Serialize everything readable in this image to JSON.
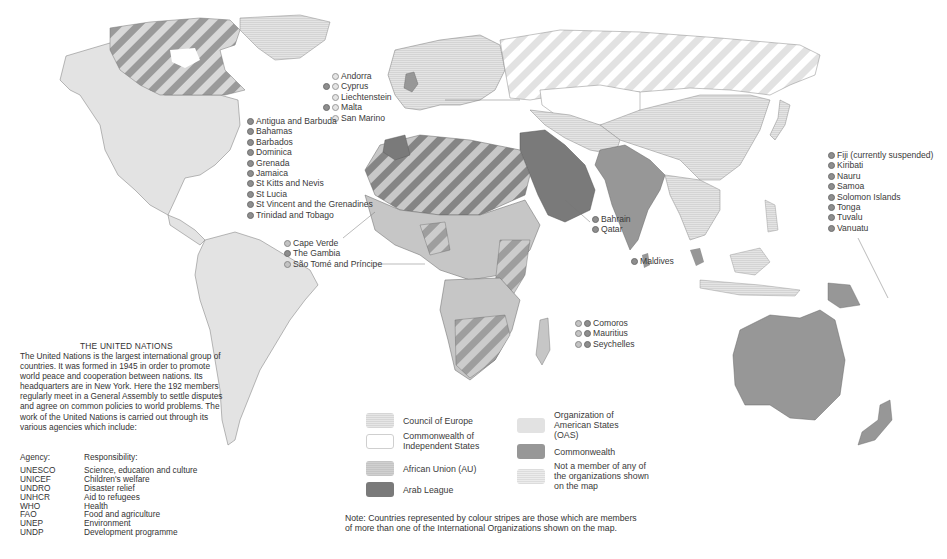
{
  "colors": {
    "council_of_europe": "#e0e0e0",
    "cis": "#ffffff",
    "african_union": "#c6c6c6",
    "arab_league": "#7a7a7a",
    "oas": "#e2e2e2",
    "commonwealth": "#979797",
    "not_member": "#e8e8e8",
    "border": "#555555"
  },
  "callouts": {
    "europe_small": [
      "Andorra",
      "Cyprus",
      "Liechtenstein",
      "Malta",
      "San Marino"
    ],
    "caribbean": [
      "Antigua and Barbuda",
      "Bahamas",
      "Barbados",
      "Dominica",
      "Grenada",
      "Jamaica",
      "St Kitts and Nevis",
      "St Lucia",
      "St Vincent and the Grenadines",
      "Trinidad and Tobago"
    ],
    "west_africa": [
      "Cape Verde",
      "The Gambia",
      "São Tomé and Príncipe"
    ],
    "gulf": [
      "Bahrain",
      "Qatar"
    ],
    "maldives": [
      "Maldives"
    ],
    "indian_ocean": [
      "Comoros",
      "Mauritius",
      "Seychelles"
    ],
    "pacific": [
      "Fiji (currently suspended)",
      "Kiribati",
      "Nauru",
      "Samoa",
      "Solomon Islands",
      "Tonga",
      "Tuvalu",
      "Vanuatu"
    ]
  },
  "un": {
    "title": "THE UNITED NATIONS",
    "body": "The United Nations is the largest international group of countries. It was formed in 1945 in order to promote world peace and cooperation between nations. Its headquarters are in New York. Here the 192 members regularly meet in a General Assembly to settle disputes and agree on common policies to world problems. The work of the United Nations is carried out through its various agencies which include:",
    "agency_header": "Agency:",
    "responsibility_header": "Responsibility:",
    "agencies": [
      {
        "agency": "UNESCO",
        "responsibility": "Science, education and culture"
      },
      {
        "agency": "UNICEF",
        "responsibility": "Children's welfare"
      },
      {
        "agency": "UNDRO",
        "responsibility": "Disaster relief"
      },
      {
        "agency": "UNHCR",
        "responsibility": "Aid to refugees"
      },
      {
        "agency": "WHO",
        "responsibility": "Health"
      },
      {
        "agency": "FAO",
        "responsibility": "Food and agriculture"
      },
      {
        "agency": "UNEP",
        "responsibility": "Environment"
      },
      {
        "agency": "UNDP",
        "responsibility": "Development programme"
      }
    ]
  },
  "legend": {
    "items": [
      {
        "label": "Council of Europe"
      },
      {
        "label": "Commonwealth of Independent States"
      },
      {
        "label": "African Union (AU)"
      },
      {
        "label": "Arab League"
      },
      {
        "label": "Organization of American States (OAS)"
      },
      {
        "label": "Commonwealth"
      },
      {
        "label": "Not a member of any of the organizations shown on the map"
      }
    ]
  },
  "note": {
    "line1": "Note: Countries represented by colour stripes are those which are members",
    "line2": "of more than one of the International Organizations shown on the map."
  }
}
